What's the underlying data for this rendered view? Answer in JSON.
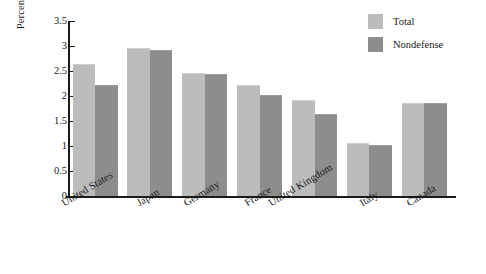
{
  "chart_data": {
    "type": "bar",
    "title": "",
    "subtitle": "",
    "xlabel": "",
    "ylabel": "Percent of GDP",
    "ylim": [
      0,
      3.5
    ],
    "yticks": [
      "0",
      "0.5",
      "1",
      "1.5",
      "2",
      "2.5",
      "3",
      "3.5"
    ],
    "ytick_values": [
      0,
      0.5,
      1,
      1.5,
      2,
      2.5,
      3,
      3.5
    ],
    "grid": false,
    "legend_position": "top-right",
    "categories": [
      "United States",
      "Japan",
      "Germany",
      "France",
      "United Kingdom",
      "Italy",
      "Canada"
    ],
    "series": [
      {
        "name": "Total",
        "color": "#bcbcbc",
        "values": [
          2.63,
          2.95,
          2.45,
          2.21,
          1.9,
          1.05,
          1.84
        ]
      },
      {
        "name": "Nondefense",
        "color": "#8d8d8d",
        "values": [
          2.2,
          2.9,
          2.42,
          2.01,
          1.62,
          1.01,
          1.84
        ]
      }
    ]
  },
  "legend": {
    "items": [
      {
        "label": "Total",
        "color": "#bcbcbc"
      },
      {
        "label": "Nondefense",
        "color": "#8d8d8d"
      }
    ]
  },
  "axes": {
    "y_title": "Percent of GDP"
  },
  "colors": {
    "axis": "#1a1a1a",
    "background": "#ffffff",
    "series_total": "#bcbcbc",
    "series_nondefense": "#8d8d8d"
  }
}
